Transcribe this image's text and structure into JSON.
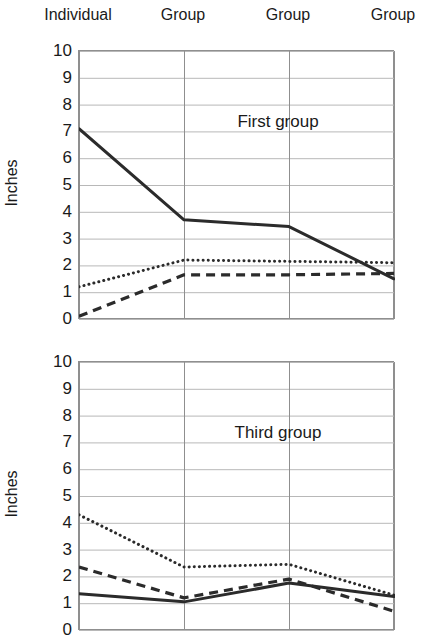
{
  "top_labels": [
    {
      "text": "Individual",
      "x": 78
    },
    {
      "text": "Group",
      "x": 183
    },
    {
      "text": "Group",
      "x": 288
    },
    {
      "text": "Group",
      "x": 393
    }
  ],
  "charts": [
    {
      "annotation": "First group",
      "ylabel": "Inches",
      "yticks": [
        "10",
        "9",
        "8",
        "7",
        "6",
        "5",
        "4",
        "3",
        "2",
        "1",
        "0"
      ]
    },
    {
      "annotation": "Third group",
      "ylabel": "Inches",
      "yticks": [
        "10",
        "9",
        "8",
        "7",
        "6",
        "5",
        "4",
        "3",
        "2",
        "1",
        "0"
      ]
    }
  ],
  "colors": {
    "line": "#2b2b2b",
    "grid": "#b8b8b8",
    "axis": "#8f8f8f",
    "text": "#1a1a1a",
    "background": "#ffffff"
  },
  "chart_data": [
    {
      "type": "line",
      "title": "First group",
      "xlabel": "",
      "ylabel": "Inches",
      "ylim": [
        0,
        10
      ],
      "yticks": [
        0,
        1,
        2,
        3,
        4,
        5,
        6,
        7,
        8,
        9,
        10
      ],
      "grid": true,
      "legend": "none",
      "categories": [
        "Individual",
        "Group",
        "Group",
        "Group"
      ],
      "x": [
        0,
        1,
        2,
        3
      ],
      "series": [
        {
          "name": "solid",
          "style": "solid",
          "values": [
            7.1,
            3.7,
            3.45,
            1.5
          ]
        },
        {
          "name": "dotted",
          "style": "dotted",
          "values": [
            1.2,
            2.2,
            2.15,
            2.1
          ]
        },
        {
          "name": "dashed",
          "style": "dashed",
          "values": [
            0.1,
            1.65,
            1.65,
            1.7
          ]
        }
      ]
    },
    {
      "type": "line",
      "title": "Third group",
      "xlabel": "",
      "ylabel": "Inches",
      "ylim": [
        0,
        10
      ],
      "yticks": [
        0,
        1,
        2,
        3,
        4,
        5,
        6,
        7,
        8,
        9,
        10
      ],
      "grid": true,
      "legend": "none",
      "categories": [
        "Individual",
        "Group",
        "Group",
        "Group"
      ],
      "x": [
        0,
        1,
        2,
        3
      ],
      "series": [
        {
          "name": "dotted",
          "style": "dotted",
          "values": [
            4.3,
            2.35,
            2.45,
            1.3
          ]
        },
        {
          "name": "dashed",
          "style": "dashed",
          "values": [
            2.35,
            1.2,
            1.9,
            0.7
          ]
        },
        {
          "name": "solid",
          "style": "solid",
          "values": [
            1.35,
            1.05,
            1.75,
            1.25
          ]
        }
      ]
    }
  ]
}
